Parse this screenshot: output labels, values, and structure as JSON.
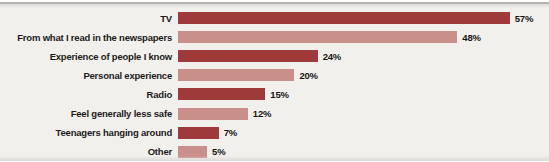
{
  "chart_data": {
    "type": "bar",
    "orientation": "horizontal",
    "title": "",
    "xlabel": "",
    "ylabel": "",
    "grid": false,
    "legend": false,
    "xlim": [
      0,
      60
    ],
    "categories": [
      "TV",
      "From what I read in the newspapers",
      "Experience of people I know",
      "Personal experience",
      "Radio",
      "Feel generally less safe",
      "Teenagers hanging around",
      "Other"
    ],
    "values": [
      57,
      48,
      24,
      20,
      15,
      12,
      7,
      5
    ],
    "value_labels": [
      "57%",
      "48%",
      "24%",
      "20%",
      "15%",
      "12%",
      "7%",
      "5%"
    ],
    "value_suffix": "%"
  },
  "colors": {
    "bar_dark": "#9e3a3a",
    "bar_light": "#c98f8a",
    "alternating_pattern": [
      "#9e3a3a",
      "#c98f8a"
    ],
    "background": "#f2f0ed",
    "label_text": "#1c1b1a",
    "value_text": "#161514",
    "top_edge_line": "#b5b3b0",
    "bottom_edge": "#dbd9d6"
  },
  "layout": {
    "px_per_percent": 5.82,
    "bar_height_px": 12,
    "row_pitch_px": 19.1,
    "label_column_px": 172
  }
}
